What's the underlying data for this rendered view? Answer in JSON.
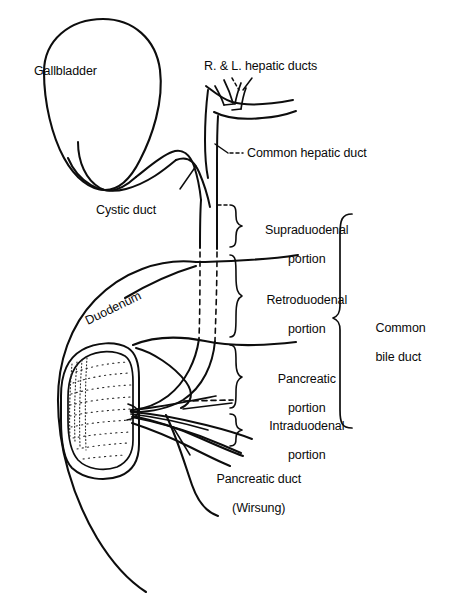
{
  "figure": {
    "background_color": "#ffffff",
    "ink_color": "#0d0d0d",
    "width": 461,
    "height": 597
  },
  "labels": {
    "gallbladder": "Gallbladder",
    "hepatic_ducts": "R. & L. hepatic ducts",
    "common_hepatic_duct": "Common hepatic duct",
    "cystic_duct": "Cystic duct",
    "duodenum": "Duodenum",
    "supraduodenal_portion_line1": "Supraduodenal",
    "supraduodenal_portion_line2": "portion",
    "retroduodenal_portion_line1": "Retroduodenal",
    "retroduodenal_portion_line2": "portion",
    "pancreatic_portion_line1": "Pancreatic",
    "pancreatic_portion_line2": "portion",
    "intraduodenal_portion_line1": "Intraduodenal",
    "intraduodenal_portion_line2": "portion",
    "common_bile_duct_line1": "Common",
    "common_bile_duct_line2": "bile duct",
    "pancreatic_duct_line1": "Pancreatic duct",
    "pancreatic_duct_line2": "(Wirsung)"
  },
  "structures": [
    "gallbladder",
    "cystic-duct",
    "right-hepatic-duct",
    "left-hepatic-duct",
    "common-hepatic-duct",
    "common-bile-duct",
    "duodenum",
    "duodenal-lumen",
    "pancreatic-duct",
    "ampulla-of-vater"
  ],
  "brackets": [
    {
      "name": "supraduodenal",
      "span_y": [
        204,
        250
      ]
    },
    {
      "name": "retroduodenal",
      "span_y": [
        254,
        338
      ]
    },
    {
      "name": "pancreatic",
      "span_y": [
        344,
        400
      ]
    },
    {
      "name": "intraduodenal",
      "span_y": [
        404,
        432
      ]
    },
    {
      "name": "common-bile-duct",
      "span_y": [
        214,
        428
      ]
    }
  ]
}
